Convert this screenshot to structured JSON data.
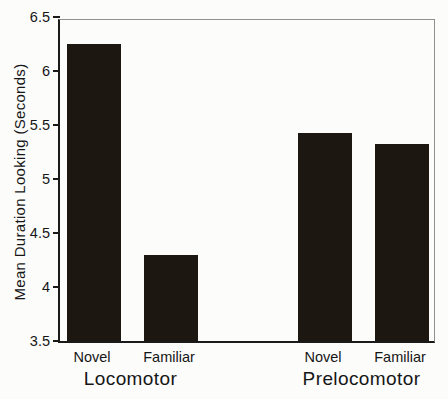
{
  "chart_data": {
    "type": "bar",
    "title": "",
    "xlabel": "",
    "ylabel": "Mean Duration Looking (Seconds)",
    "ylim": [
      3.5,
      6.5
    ],
    "ytick_interval": 0.5,
    "ytick_labels": [
      "3.5",
      "4",
      "4.5",
      "5",
      "5.5",
      "6",
      "6.5"
    ],
    "grid": false,
    "legend": "none",
    "bar_color": "#1d1712",
    "axis_color": "#1a1a1a",
    "groups": [
      {
        "label": "Locomotor",
        "categories": [
          "Novel",
          "Familiar"
        ],
        "values": [
          6.25,
          4.3
        ]
      },
      {
        "label": "Prelocomotor",
        "categories": [
          "Novel",
          "Familiar"
        ],
        "values": [
          5.43,
          5.32
        ]
      }
    ],
    "layout": {
      "bar_centers_px": [
        34,
        111,
        265,
        342
      ],
      "bar_width_px": 54,
      "plot_left_px": 58,
      "plot_top_px": 19,
      "plot_width_px": 377,
      "plot_height_px": 324
    }
  }
}
